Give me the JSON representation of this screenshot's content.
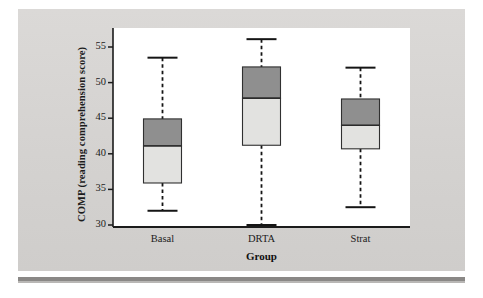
{
  "figure": {
    "background_color": "#d6d4d2",
    "panel_color": "#ffffff",
    "axis_color": "#1b1b1b"
  },
  "axes": {
    "y_title": "COMP (reading comprehension score)",
    "x_title": "Group",
    "y_ticks": [
      "30",
      "35",
      "40",
      "45",
      "50",
      "55"
    ],
    "x_ticks": [
      "Basal",
      "DRTA",
      "Strat"
    ]
  },
  "chart_data": {
    "type": "box",
    "title": "",
    "xlabel": "Group",
    "ylabel": "COMP (reading comprehension score)",
    "ylim": [
      29.0,
      57.3
    ],
    "ytick_values": [
      30,
      35,
      40,
      45,
      50,
      55
    ],
    "grid": false,
    "legend": null,
    "categories": [
      "Basal",
      "DRTA",
      "Strat"
    ],
    "box_fill_upper": "#8f8f8f",
    "box_fill_lower": "#e2e2e0",
    "boxes": [
      {
        "category": "Basal",
        "whisker_low": 32.0,
        "q1": 35.9,
        "median": 41.1,
        "q3": 44.9,
        "whisker_high": 53.5,
        "outliers": []
      },
      {
        "category": "DRTA",
        "whisker_low": 30.0,
        "q1": 41.2,
        "median": 47.8,
        "q3": 52.2,
        "whisker_high": 56.1,
        "outliers": []
      },
      {
        "category": "Strat",
        "whisker_low": 32.5,
        "q1": 40.7,
        "median": 44.0,
        "q3": 47.7,
        "whisker_high": 52.1,
        "outliers": []
      }
    ]
  }
}
